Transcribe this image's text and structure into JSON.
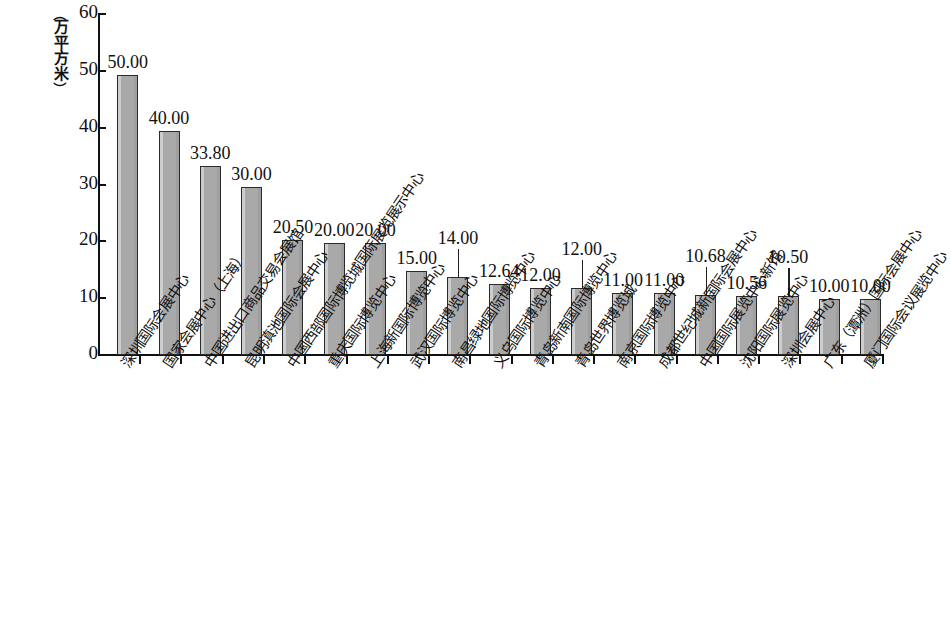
{
  "chart_data": {
    "type": "bar",
    "title": "",
    "subtitle": "",
    "xlabel": "",
    "ylabel": "（万平方米）",
    "ylabel_chars": [
      "（",
      "万",
      "平",
      "方",
      "米",
      "）"
    ],
    "ylim": [
      0,
      60
    ],
    "yticks": [
      0,
      10,
      20,
      30,
      40,
      50,
      60
    ],
    "ytick_labels": [
      "0",
      "10",
      "20",
      "30",
      "40",
      "50",
      "60"
    ],
    "grid": false,
    "legend": null,
    "bar_color": "#a9a9a9",
    "bar_edge_color": "#2b2b2b",
    "axis_color": "#111111",
    "categories": [
      "深圳国际会展中心",
      "国家会展中心（上海）",
      "中国进出口商品交易会展馆",
      "昆明滇池国际会展中心",
      "中国西部国际博览城国际展览展示中心",
      "重庆国际博览中心",
      "上海新国际博览中心",
      "武汉国际博览中心",
      "南昌绿地国际博览中心",
      "义乌国际博览中心",
      "青岛新南国际博览中心",
      "青岛世界博览城",
      "南京国际博览中心",
      "成都世纪城新国际会展中心",
      "中国国际展览中心新馆",
      "沈阳国际展览中心",
      "深圳会展中心",
      "广东（潭洲）国际会展中心",
      "厦门国际会议展览中心"
    ],
    "values": [
      50.0,
      40.0,
      33.8,
      30.0,
      20.5,
      20.0,
      20.0,
      15.0,
      14.0,
      12.64,
      12.0,
      12.0,
      11.0,
      11.0,
      10.68,
      10.56,
      10.5,
      10.0,
      10.0
    ],
    "value_labels": [
      "50.00",
      "40.00",
      "33.80",
      "30.00",
      "20.50",
      "20.00",
      "20.00",
      "15.00",
      "14.00",
      "12.64",
      "12.00",
      "12.00",
      "11.00",
      "11.00",
      "10.68",
      "10.56",
      "10.50",
      "10.00",
      "10.00"
    ],
    "label_raised": [
      false,
      false,
      false,
      false,
      false,
      false,
      false,
      false,
      true,
      false,
      false,
      true,
      false,
      false,
      true,
      false,
      true,
      false,
      false
    ]
  }
}
